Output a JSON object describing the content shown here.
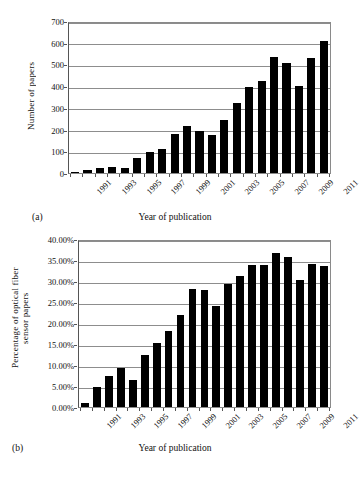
{
  "chart_data": [
    {
      "type": "bar",
      "panel": "(a)",
      "title": "",
      "xlabel": "Year of publication",
      "ylabel": "Number of papers",
      "ylim": [
        0,
        700
      ],
      "yticks": [
        0,
        100,
        200,
        300,
        400,
        500,
        600,
        700
      ],
      "ytick_labels": [
        "0",
        "100",
        "200",
        "300",
        "400",
        "500",
        "600",
        "700"
      ],
      "grid": true,
      "legend": "none",
      "categories": [
        "1991",
        "1992",
        "1993",
        "1994",
        "1995",
        "1996",
        "1997",
        "1998",
        "1999",
        "2000",
        "2001",
        "2002",
        "2003",
        "2004",
        "2005",
        "2006",
        "2007",
        "2008",
        "2009",
        "2010",
        "2011"
      ],
      "tick_labels_shown": [
        "1991",
        "",
        "1993",
        "",
        "1995",
        "",
        "1997",
        "",
        "1999",
        "",
        "2001",
        "",
        "2003",
        "",
        "2005",
        "",
        "2007",
        "",
        "2009",
        "",
        "2011"
      ],
      "values": [
        3,
        13,
        21,
        30,
        24,
        69,
        99,
        111,
        179,
        217,
        193,
        174,
        243,
        323,
        396,
        424,
        535,
        505,
        402,
        529,
        610
      ]
    },
    {
      "type": "bar",
      "panel": "(b)",
      "title": "",
      "xlabel": "Year of publication",
      "ylabel": "Percentage of optical fiber sensor papers",
      "ylabel_lines": [
        "Percentage of optical fiber",
        "sensor papers"
      ],
      "ylim": [
        0,
        40
      ],
      "yticks": [
        0,
        5,
        10,
        15,
        20,
        25,
        30,
        35,
        40
      ],
      "ytick_labels": [
        "0.00%",
        "5.00%",
        "10.00%",
        "15.00%",
        "20.00%",
        "25.00%",
        "30.00%",
        "35.00%",
        "40.00%"
      ],
      "grid": true,
      "legend": "none",
      "categories": [
        "1991",
        "1992",
        "1993",
        "1994",
        "1995",
        "1996",
        "1997",
        "1998",
        "1999",
        "2000",
        "2001",
        "2002",
        "2003",
        "2004",
        "2005",
        "2006",
        "2007",
        "2008",
        "2009",
        "2010",
        "2011"
      ],
      "tick_labels_shown": [
        "1991",
        "",
        "1993",
        "",
        "1995",
        "",
        "1997",
        "",
        "1999",
        "",
        "2001",
        "",
        "2003",
        "",
        "2005",
        "",
        "2007",
        "",
        "2009",
        "",
        "2011"
      ],
      "values": [
        0.85,
        4.7,
        7.35,
        9.4,
        6.45,
        12.35,
        15.15,
        18.05,
        21.9,
        28.0,
        27.75,
        24.1,
        29.3,
        31.3,
        33.8,
        33.8,
        36.7,
        35.6,
        30.3,
        33.95,
        33.6
      ]
    }
  ],
  "colors": {
    "bar": "#000000",
    "grid": "#8d8d8d",
    "axis": "#555555",
    "background": "#ffffff"
  }
}
